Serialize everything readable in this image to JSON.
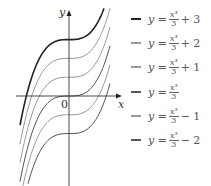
{
  "chart_data": {
    "type": "line",
    "title": "",
    "xlabel": "x",
    "ylabel": "y",
    "origin_label": "0",
    "function": "y = x^3/3 + c",
    "series": [
      {
        "name": "y = x^3/3 + 3",
        "c": 3,
        "color": "#222222",
        "bold": true
      },
      {
        "name": "y = x^3/3 + 2",
        "c": 2,
        "color": "#9a9a9a",
        "bold": false
      },
      {
        "name": "y = x^3/3 + 1",
        "c": 1,
        "color": "#9a9a9a",
        "bold": false
      },
      {
        "name": "y = x^3/3",
        "c": 0,
        "color": "#555555",
        "bold": false
      },
      {
        "name": "y = x^3/3 - 1",
        "c": -1,
        "color": "#9a9a9a",
        "bold": false
      },
      {
        "name": "y = x^3/3 - 2",
        "c": -2,
        "color": "#555555",
        "bold": false
      }
    ],
    "grid": false,
    "legend_position": "right"
  },
  "legend": [
    {
      "prefix": "y =",
      "num": "x³",
      "den": "3",
      "suffix": "+ 3"
    },
    {
      "prefix": "y =",
      "num": "x³",
      "den": "3",
      "suffix": "+ 2"
    },
    {
      "prefix": "y =",
      "num": "x³",
      "den": "3",
      "suffix": "+ 1"
    },
    {
      "prefix": "y =",
      "num": "x³",
      "den": "3",
      "suffix": ""
    },
    {
      "prefix": "y =",
      "num": "x³",
      "den": "3",
      "suffix": "− 1"
    },
    {
      "prefix": "y =",
      "num": "x³",
      "den": "3",
      "suffix": "− 2"
    }
  ]
}
